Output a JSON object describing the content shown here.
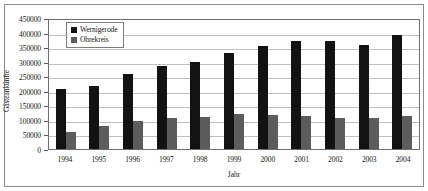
{
  "chart_data": {
    "type": "bar",
    "title": "",
    "xlabel": "Jahr",
    "ylabel": "Gästeankünfte",
    "categories": [
      "1994",
      "1995",
      "1996",
      "1997",
      "1998",
      "1999",
      "2000",
      "2001",
      "2002",
      "2003",
      "2004"
    ],
    "series": [
      {
        "name": "Wernigerode",
        "color": "#121212",
        "values": [
          207000,
          218000,
          258000,
          285000,
          300000,
          330000,
          355000,
          372000,
          372000,
          358000,
          390000
        ]
      },
      {
        "name": "Ohrekreis",
        "color": "#5c5c5c",
        "values": [
          58000,
          80000,
          97000,
          105000,
          110000,
          122000,
          118000,
          113000,
          105000,
          108000,
          115000
        ]
      }
    ],
    "ylim": [
      0,
      450000
    ],
    "ytick_step": 50000,
    "yticks": [
      "450000",
      "400000",
      "350000",
      "300000",
      "250000",
      "200000",
      "150000",
      "100000",
      "50000",
      "0"
    ],
    "grid": true,
    "legend_position": "top-left"
  }
}
